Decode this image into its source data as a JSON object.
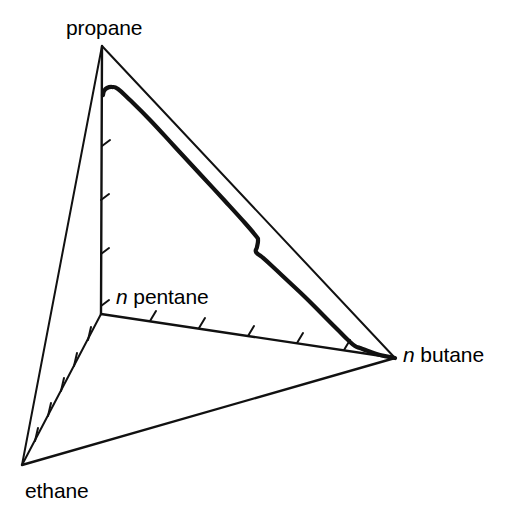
{
  "figure": {
    "kind": "quaternary-phase-diagram",
    "background_color": "#ffffff",
    "line_color": "#000000"
  },
  "labels": {
    "propane": "propane",
    "ethane": "ethane",
    "n_pentane_italic": "n",
    "n_pentane_rest": " pentane",
    "n_butane_italic": "n",
    "n_butane_rest": " butane"
  },
  "chart_data": {
    "type": "line",
    "title": "",
    "subtitle": "",
    "xlabel": "",
    "ylabel": "",
    "grid": false,
    "legend": "none",
    "vertices": [
      {
        "name": "propane",
        "x": 102,
        "y": 46,
        "label": "propane"
      },
      {
        "name": "ethane",
        "x": 22,
        "y": 465,
        "label": "ethane"
      },
      {
        "name": "n pentane",
        "x": 101,
        "y": 314,
        "label": "n pentane"
      },
      {
        "name": "n butane",
        "x": 395,
        "y": 358,
        "label": "n butane"
      }
    ],
    "edges": [
      {
        "from": "propane",
        "to": "ethane",
        "style": "thin",
        "ticks": 0
      },
      {
        "from": "propane",
        "to": "n pentane",
        "style": "thin",
        "ticks": 5
      },
      {
        "from": "propane",
        "to": "n butane",
        "style": "thin",
        "ticks": 0
      },
      {
        "from": "ethane",
        "to": "n pentane",
        "style": "thin",
        "ticks": 5
      },
      {
        "from": "ethane",
        "to": "n butane",
        "style": "thin",
        "ticks": 0
      },
      {
        "from": "n pentane",
        "to": "n butane",
        "style": "thin",
        "ticks": 5
      }
    ],
    "series": [
      {
        "name": "phase boundary",
        "style": "thick",
        "points": [
          [
            103,
            95
          ],
          [
            104,
            91
          ],
          [
            107,
            88
          ],
          [
            112,
            87
          ],
          [
            118,
            89
          ],
          [
            130,
            100
          ],
          [
            150,
            120
          ],
          [
            175,
            147
          ],
          [
            200,
            174
          ],
          [
            225,
            201
          ],
          [
            245,
            223
          ],
          [
            256,
            236
          ],
          [
            258,
            240
          ],
          [
            257,
            247
          ],
          [
            256,
            252
          ],
          [
            262,
            257
          ],
          [
            272,
            266
          ],
          [
            288,
            281
          ],
          [
            305,
            297
          ],
          [
            322,
            314
          ],
          [
            338,
            330
          ],
          [
            348,
            340
          ],
          [
            355,
            346
          ],
          [
            360,
            348
          ],
          [
            368,
            351
          ],
          [
            380,
            355
          ],
          [
            395,
            358
          ]
        ]
      },
      {
        "name": "propane to n butane edge",
        "style": "thin",
        "points": [
          [
            102,
            46
          ],
          [
            395,
            358
          ]
        ]
      }
    ],
    "tick_marks": {
      "propane_npentane_edge": [
        {
          "x": 102,
          "y": 92
        },
        {
          "x": 102,
          "y": 146
        },
        {
          "x": 101,
          "y": 200
        },
        {
          "x": 101,
          "y": 254
        },
        {
          "x": 101,
          "y": 308
        }
      ],
      "ethane_npentane_edge": [
        {
          "x": 35,
          "y": 440
        },
        {
          "x": 48,
          "y": 415
        },
        {
          "x": 61,
          "y": 390
        },
        {
          "x": 75,
          "y": 364
        },
        {
          "x": 88,
          "y": 339
        }
      ],
      "npentane_nbutane_edge": [
        {
          "x": 150,
          "y": 321
        },
        {
          "x": 199,
          "y": 328
        },
        {
          "x": 248,
          "y": 335
        },
        {
          "x": 297,
          "y": 343
        },
        {
          "x": 346,
          "y": 350
        }
      ]
    }
  }
}
